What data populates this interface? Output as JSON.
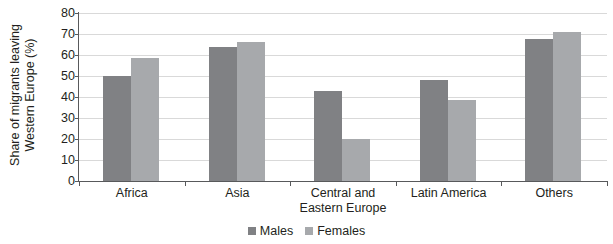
{
  "chart_data": {
    "type": "bar",
    "title": "",
    "xlabel": "",
    "ylabel": "Share of migrants leaving Western Europe (%)",
    "ylabel_line1": "Share of migrants leaving",
    "ylabel_line2": "Western Europe (%)",
    "ylim": [
      0,
      80
    ],
    "ytick_step": 10,
    "yticks": [
      "80",
      "70",
      "60",
      "50",
      "40",
      "30",
      "20",
      "10",
      "0"
    ],
    "ytick_values": [
      80,
      70,
      60,
      50,
      40,
      30,
      20,
      10,
      0
    ],
    "grid": true,
    "legend_position": "bottom-center",
    "categories": [
      "Africa",
      "Asia",
      "Central and Eastern Europe",
      "Latin America",
      "Others"
    ],
    "category_lines": [
      [
        "Africa"
      ],
      [
        "Asia"
      ],
      [
        "Central and",
        "Eastern Europe"
      ],
      [
        "Latin America"
      ],
      [
        "Others"
      ]
    ],
    "series": [
      {
        "name": "Males",
        "color": "#808184",
        "values": [
          50,
          64,
          43,
          48,
          67.5
        ]
      },
      {
        "name": "Females",
        "color": "#a7a9ac",
        "values": [
          58.5,
          66,
          20,
          38.5,
          71
        ]
      }
    ]
  },
  "legend": {
    "items": [
      {
        "label": "Males",
        "color": "#808184"
      },
      {
        "label": "Females",
        "color": "#a7a9ac"
      }
    ]
  },
  "colors": {
    "males": "#808184",
    "females": "#a7a9ac",
    "gridline": "#d9d9d9",
    "axis": "#58595b",
    "text": "#231f20",
    "background": "#ffffff"
  }
}
